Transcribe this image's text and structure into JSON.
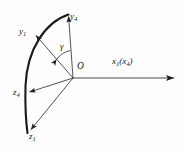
{
  "figure": {
    "type": "vector-coordinate-diagram",
    "background_color": "#fdfdfd",
    "stroke_color": "#1a1a1a",
    "labels": {
      "y4": {
        "base": "y",
        "sub": "4",
        "text": "y4"
      },
      "y1": {
        "base": "y",
        "sub": "1",
        "text": "y1"
      },
      "z4": {
        "base": "z",
        "sub": "4",
        "text": "z4"
      },
      "z1": {
        "base": "z",
        "sub": "1",
        "text": "z1"
      },
      "origin": {
        "text": "O"
      },
      "angle": {
        "text": "γ"
      },
      "x_axis": {
        "base": "x",
        "sub": "1",
        "paren_base": "x",
        "paren_sub": "4",
        "text": "x1(x4)"
      }
    },
    "geometry": {
      "origin": {
        "x": 73,
        "y": 78
      },
      "arrows": [
        {
          "name": "y4",
          "to": {
            "x": 68,
            "y": 14
          }
        },
        {
          "name": "y1",
          "to": {
            "x": 34,
            "y": 34
          }
        },
        {
          "name": "z4",
          "to": {
            "x": 27,
            "y": 92
          }
        },
        {
          "name": "z1",
          "to": {
            "x": 29,
            "y": 131
          }
        },
        {
          "name": "x1x4",
          "to": {
            "x": 176,
            "y": 78
          }
        }
      ],
      "arc": {
        "from": {
          "x": 68,
          "y": 14
        },
        "to": {
          "x": 27,
          "y": 133
        },
        "thick": true
      }
    }
  }
}
